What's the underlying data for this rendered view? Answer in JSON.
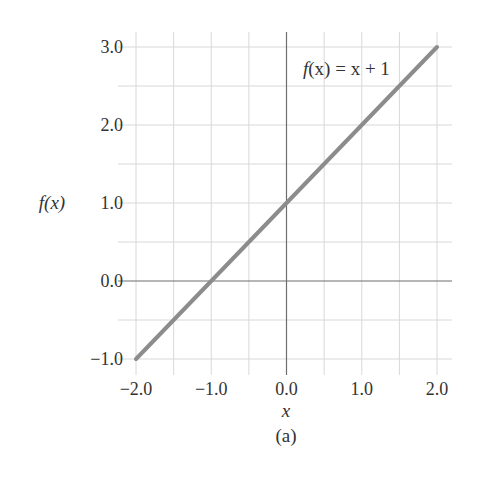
{
  "chart_data": {
    "type": "line",
    "title": "",
    "caption": "(a)",
    "xlabel": "x",
    "ylabel": "f(x)",
    "xlim": [
      -2.0,
      2.0
    ],
    "ylim": [
      -1.0,
      3.0
    ],
    "grid": true,
    "grid_step_x": 0.5,
    "grid_step_y": 0.5,
    "xticks": [
      -2.0,
      -1.0,
      0.0,
      1.0,
      2.0
    ],
    "xtick_labels": [
      "−2.0",
      "−1.0",
      "0.0",
      "1.0",
      "2.0"
    ],
    "yticks": [
      -1.0,
      0.0,
      1.0,
      2.0,
      3.0
    ],
    "ytick_labels": [
      "−1.0",
      "0.0",
      "1.0",
      "2.0",
      "3.0"
    ],
    "series": [
      {
        "name": "f(x) = x + 1",
        "x": [
          -2.0,
          -1.0,
          0.0,
          1.0,
          2.0
        ],
        "y": [
          -1.0,
          0.0,
          1.0,
          2.0,
          3.0
        ],
        "color": "#8c8c8c"
      }
    ],
    "annotations": [
      {
        "text": "f(x) = x + 1",
        "x": 0.25,
        "y": 2.75
      }
    ],
    "legend": null
  },
  "labels": {
    "ylabel": "f(x)",
    "xlabel": "x",
    "caption": "(a)",
    "annotation_f": "f",
    "annotation_rest": "(x) = x + 1"
  },
  "colors": {
    "line": "#8c8c8c",
    "grid": "#d8d8d8",
    "axis": "#6e6e6e",
    "text": "#333333"
  }
}
